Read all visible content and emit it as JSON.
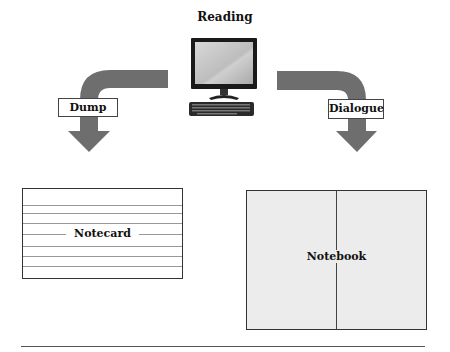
{
  "diagram": {
    "source": {
      "label": "Reading",
      "icon": "desktop-computer-icon"
    },
    "branches": [
      {
        "label": "Dump",
        "arrow_direction": "left-down"
      },
      {
        "label": "Dialogue",
        "arrow_direction": "right-down"
      }
    ],
    "outputs": [
      {
        "label": "Notecard",
        "style": "ruled-card"
      },
      {
        "label": "Notebook",
        "style": "two-column-page"
      }
    ],
    "colors": {
      "arrow": "#6e6e6e",
      "notebook_fill": "#ececec",
      "card_lines": "#999999"
    }
  }
}
